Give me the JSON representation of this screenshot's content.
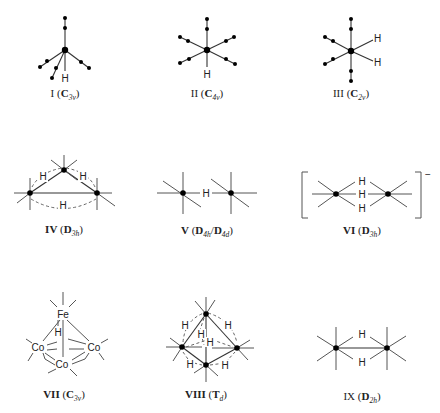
{
  "figure": {
    "structures": [
      {
        "id": "I",
        "numeral": "I",
        "point_group": "C",
        "pg_sub": "3v",
        "atoms": [
          "H"
        ]
      },
      {
        "id": "II",
        "numeral": "II",
        "point_group": "C",
        "pg_sub": "4v",
        "atoms": [
          "H"
        ]
      },
      {
        "id": "III",
        "numeral": "III",
        "point_group": "C",
        "pg_sub": "2v",
        "atoms": [
          "H",
          "H"
        ]
      },
      {
        "id": "IV",
        "numeral": "IV",
        "point_group": "D",
        "pg_sub": "3h",
        "atoms": [
          "H",
          "H",
          "H"
        ]
      },
      {
        "id": "V",
        "numeral": "V",
        "point_group": "D",
        "pg_sub": "4h",
        "point_group2": "D",
        "pg_sub2": "4d",
        "atoms": [
          "H"
        ]
      },
      {
        "id": "VI",
        "numeral": "VI",
        "point_group": "D",
        "pg_sub": "3h",
        "atoms": [
          "H",
          "H",
          "H"
        ],
        "charge": "−"
      },
      {
        "id": "VII",
        "numeral": "VII",
        "point_group": "C",
        "pg_sub": "3v",
        "atoms": [
          "Fe",
          "H",
          "Co",
          "Co",
          "Co"
        ]
      },
      {
        "id": "VIII",
        "numeral": "VIII",
        "point_group": "T",
        "pg_sub": "d",
        "atoms": [
          "H",
          "H",
          "H",
          "H",
          "H",
          "H"
        ]
      },
      {
        "id": "IX",
        "numeral": "IX",
        "point_group": "D",
        "pg_sub": "2h",
        "atoms": [
          "H",
          "H"
        ]
      }
    ]
  }
}
